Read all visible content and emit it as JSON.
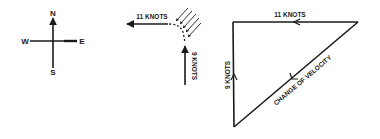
{
  "compass": {
    "north": "N",
    "south": "S",
    "east": "E",
    "west": "W"
  },
  "middle_figure": {
    "horizontal_label": "11 KNOTS",
    "vertical_label": "9 KNOTS"
  },
  "triangle": {
    "top_label": "11 KNOTS",
    "left_label": "9 KNOTS",
    "hypotenuse_label": "CHANGE OF VELOCITY"
  },
  "colors": {
    "ink": "#1a1a1a",
    "background": "#ffffff"
  }
}
